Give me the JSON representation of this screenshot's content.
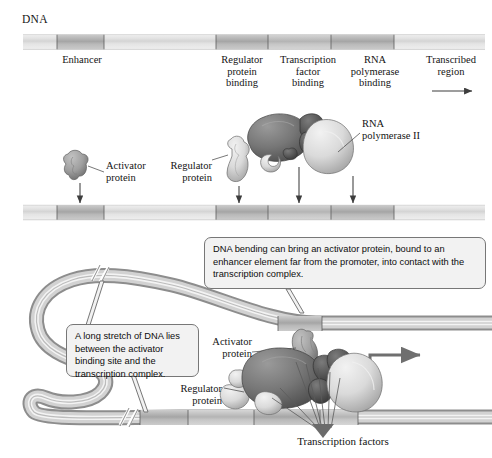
{
  "figure": {
    "title_label": "DNA",
    "background_color": "#ffffff",
    "text_color": "#141414",
    "callout_fill": "#f2f2f2",
    "callout_stroke": "#777777"
  },
  "panel_top": {
    "dna_label": "DNA",
    "segment_labels": [
      {
        "name": "enhancer",
        "text": "Enhancer"
      },
      {
        "name": "regulator-protein-binding",
        "text": "Regulator\nprotein\nbinding"
      },
      {
        "name": "transcription-factor-binding",
        "text": "Transcription\nfactor\nbinding"
      },
      {
        "name": "rna-polymerase-binding",
        "text": "RNA\npolymerase\nbinding"
      },
      {
        "name": "transcribed-region",
        "text": "Transcribed\nregion"
      }
    ],
    "direction_arrow": "rightward-transcription-arrow"
  },
  "panel_middle": {
    "labels": [
      {
        "name": "activator-protein",
        "text": "Activator\nprotein"
      },
      {
        "name": "regulator-protein",
        "text": "Regulator\nprotein"
      },
      {
        "name": "rna-polymerase-ii",
        "text": "RNA\npolymerase II"
      }
    ],
    "binding_arrows": 4
  },
  "panel_bottom": {
    "callouts": [
      {
        "name": "dna-bending-callout",
        "text": "DNA bending can bring an activator protein, bound to an enhancer element far from the promoter, into contact with the transcription complex."
      },
      {
        "name": "long-stretch-callout",
        "text": "A long stretch of DNA lies between the activator binding site and the transcription complex."
      }
    ],
    "labels": [
      {
        "name": "activator-protein",
        "text": "Activator\nprotein"
      },
      {
        "name": "regulator-protein",
        "text": "Regulator\nprotein"
      },
      {
        "name": "transcription-factors",
        "text": "Transcription factors"
      }
    ]
  },
  "palette": {
    "dna_light": "#e8e8e8",
    "dna_mid": "#cfcfcf",
    "dna_dark": "#b0b0b0",
    "dna_darker": "#a0a0a0",
    "outline": "#4a4a4a",
    "protein_dark": "#6e6e6e",
    "protein_mid": "#9a9a9a",
    "protein_light": "#d8d8d8",
    "arrow": "#3a3a3a"
  }
}
